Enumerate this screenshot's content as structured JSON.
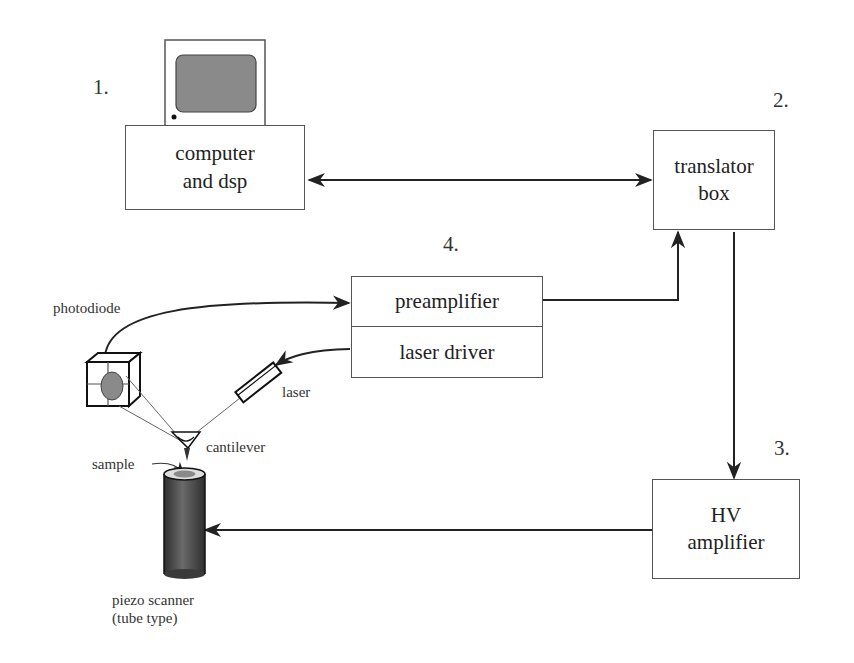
{
  "diagram": {
    "type": "block-diagram",
    "blocks": {
      "computer": {
        "number": "1.",
        "line1": "computer",
        "line2": "and dsp"
      },
      "translator": {
        "number": "2.",
        "line1": "translator",
        "line2": "box"
      },
      "hv_amplifier": {
        "number": "3.",
        "line1": "HV",
        "line2": "amplifier"
      },
      "preamp_driver": {
        "number": "4.",
        "top": "preamplifier",
        "bottom": "laser driver"
      }
    },
    "components": {
      "photodiode": "photodiode",
      "laser": "laser",
      "cantilever": "cantilever",
      "sample": "sample",
      "scanner_line1": "piezo scanner",
      "scanner_line2": "(tube type)"
    },
    "connections": [
      {
        "from": "computer and dsp",
        "to": "translator box",
        "direction": "bidirectional"
      },
      {
        "from": "translator box",
        "to": "HV amplifier",
        "direction": "forward"
      },
      {
        "from": "HV amplifier",
        "to": "piezo scanner",
        "direction": "forward"
      },
      {
        "from": "preamplifier",
        "to": "translator box",
        "direction": "forward"
      },
      {
        "from": "photodiode",
        "to": "preamplifier",
        "direction": "forward"
      },
      {
        "from": "laser driver",
        "to": "laser",
        "direction": "forward"
      }
    ],
    "colors": {
      "line": "#222222",
      "box_border": "#555555",
      "screen_fill": "#8a8a8a",
      "tube_fill_dark": "#3a3a3a",
      "tube_fill_light": "#7a7a7a"
    }
  }
}
